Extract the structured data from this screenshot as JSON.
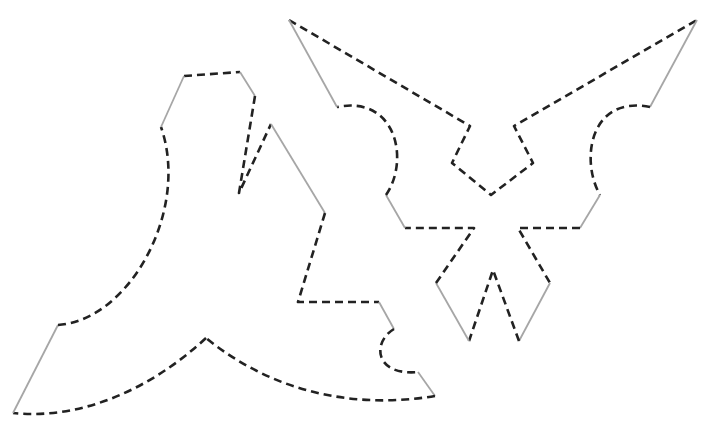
{
  "diagram": {
    "type": "paper-cutting templates",
    "legend": {
      "cut_line": {
        "style": "dashed",
        "color": "#222222"
      },
      "fold_line": {
        "style": "solid",
        "color": "#a6a6a6"
      }
    },
    "shapes": [
      {
        "name": "left-template",
        "description": "curved boomerang-like piece with notch and arc tab"
      },
      {
        "name": "right-template",
        "description": "symmetric winged piece with two semicircular bumps and center notches"
      }
    ]
  }
}
